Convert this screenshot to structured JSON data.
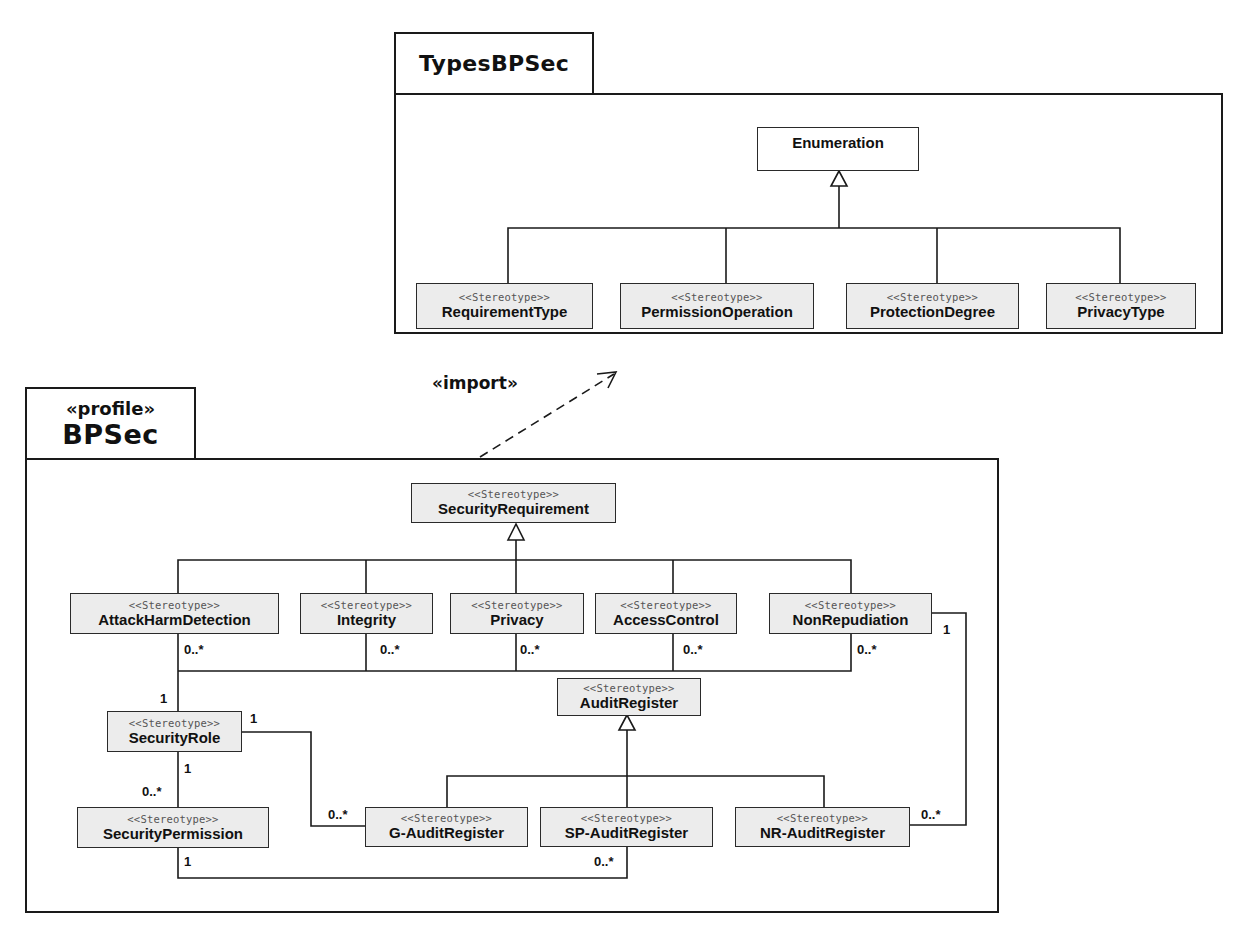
{
  "types_package": {
    "name": "TypesBPSec",
    "base_class": "Enumeration",
    "enumerations": [
      {
        "stereotype": "<<Stereotype>>",
        "name": "RequirementType"
      },
      {
        "stereotype": "<<Stereotype>>",
        "name": "PermissionOperation"
      },
      {
        "stereotype": "<<Stereotype>>",
        "name": "ProtectionDegree"
      },
      {
        "stereotype": "<<Stereotype>>",
        "name": "PrivacyType"
      }
    ]
  },
  "import_dependency": {
    "label": "«import»"
  },
  "profile_package": {
    "stereotype": "«profile»",
    "name": "BPSec",
    "security_requirement": {
      "stereotype": "<<Stereotype>>",
      "name": "SecurityRequirement"
    },
    "requirements": [
      {
        "stereotype": "<<Stereotype>>",
        "name": "AttackHarmDetection",
        "multiplicity": "0..*"
      },
      {
        "stereotype": "<<Stereotype>>",
        "name": "Integrity",
        "multiplicity": "0..*"
      },
      {
        "stereotype": "<<Stereotype>>",
        "name": "Privacy",
        "multiplicity": "0..*"
      },
      {
        "stereotype": "<<Stereotype>>",
        "name": "AccessControl",
        "multiplicity": "0..*"
      },
      {
        "stereotype": "<<Stereotype>>",
        "name": "NonRepudiation",
        "multiplicity": "0..*"
      }
    ],
    "security_role": {
      "stereotype": "<<Stereotype>>",
      "name": "SecurityRole"
    },
    "security_permission": {
      "stereotype": "<<Stereotype>>",
      "name": "SecurityPermission"
    },
    "audit_register": {
      "stereotype": "<<Stereotype>>",
      "name": "AuditRegister"
    },
    "audit_registers": [
      {
        "stereotype": "<<Stereotype>>",
        "name": "G-AuditRegister"
      },
      {
        "stereotype": "<<Stereotype>>",
        "name": "SP-AuditRegister"
      },
      {
        "stereotype": "<<Stereotype>>",
        "name": "NR-AuditRegister"
      }
    ],
    "multiplicities": {
      "role_to_requirements": "1",
      "role_to_gaudit_role_end": "1",
      "role_to_gaudit_audit_end": "0..*",
      "role_to_permission_role_end": "1",
      "role_to_permission_perm_end": "0..*",
      "permission_to_spaudit_perm_end": "1",
      "permission_to_spaudit_audit_end": "0..*",
      "nonrep_to_nraudit_nonrep_end": "1",
      "nonrep_to_nraudit_audit_end": "0..*"
    }
  }
}
